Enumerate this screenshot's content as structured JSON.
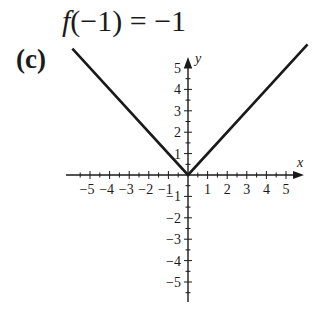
{
  "header": {
    "equation_fn": "f",
    "equation_rest": "(−1) = −1",
    "panel_label": "(c)"
  },
  "chart_data": {
    "type": "line",
    "title": "f(−1) = −1",
    "panel": "(c)",
    "function": "y = |x|",
    "xlabel": "x",
    "ylabel": "y",
    "xlim": [
      -6,
      6
    ],
    "ylim": [
      -6,
      6
    ],
    "grid": false,
    "legend": null,
    "x_tick_labels": [
      "−5",
      "−4",
      "−3",
      "−2",
      "−1",
      "1",
      "2",
      "3",
      "4",
      "5"
    ],
    "y_tick_labels": [
      "5",
      "4",
      "3",
      "2",
      "1",
      "−1",
      "−2",
      "−3",
      "−4",
      "−5"
    ],
    "x_ticks": [
      -5,
      -4,
      -3,
      -2,
      -1,
      1,
      2,
      3,
      4,
      5
    ],
    "y_ticks": [
      5,
      4,
      3,
      2,
      1,
      -1,
      -2,
      -3,
      -4,
      -5
    ],
    "series": [
      {
        "name": "|x|",
        "x": [
          -5.9,
          0,
          6.1
        ],
        "y": [
          5.9,
          0,
          6.1
        ],
        "color": "#1a1a1a"
      }
    ]
  },
  "colors": {
    "ink": "#1a1a1a",
    "background": "#ffffff"
  }
}
